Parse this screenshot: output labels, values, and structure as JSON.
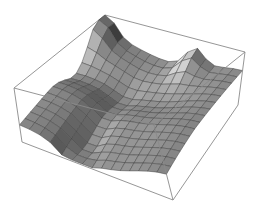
{
  "chart_data": {
    "type": "surface3d",
    "title": "",
    "xlabel": "",
    "ylabel": "",
    "zlabel": "",
    "axes_ticks": false,
    "grid": false,
    "box": true,
    "colormap": "grayscale-shaded",
    "mesh_resolution": [
      15,
      15
    ],
    "peaks": [
      {
        "u": 0.0,
        "v": 0.05,
        "height": 1.0
      },
      {
        "u": 0.65,
        "v": 0.0,
        "height": 0.85
      }
    ],
    "zlim": [
      0,
      1
    ],
    "box_corners_px": {
      "top_back": [
        105,
        15
      ],
      "top_left": [
        14,
        88
      ],
      "top_right": [
        245,
        52
      ],
      "top_front": [
        154,
        125
      ],
      "bottom_back": [
        105,
        70
      ],
      "bottom_left": [
        22,
        142
      ],
      "bottom_right": [
        238,
        105
      ],
      "bottom_front": [
        173,
        200
      ]
    }
  },
  "colors": {
    "background": "#ffffff",
    "box": "#8a8a8a",
    "mesh_line": "#3c3c3c",
    "surface_light": "#d8d8d8",
    "surface_dark": "#3a3a3a"
  }
}
